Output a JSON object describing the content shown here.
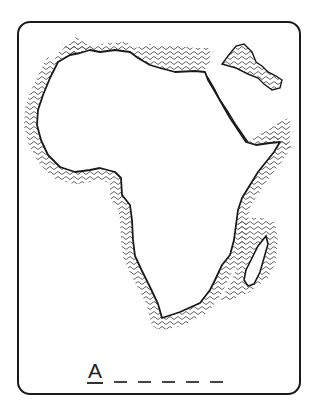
{
  "worksheet": {
    "subject": "map-of-africa",
    "answer_first_letter": "A",
    "blank_count": 5,
    "colors": {
      "border": "#1a1a1a",
      "coastline": "#1a1a1a",
      "sea_hatch": "#555555",
      "land": "#ffffff"
    }
  }
}
